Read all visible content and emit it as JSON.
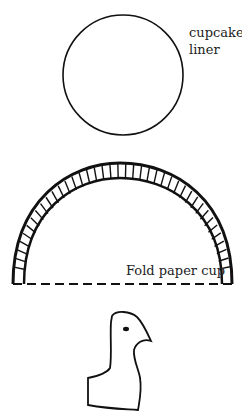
{
  "labels": {
    "liner_line1": "cupcake",
    "liner_line2": "liner",
    "fold": "Fold paper cup"
  },
  "colors": {
    "ink": "#111111",
    "background": "#ffffff"
  }
}
